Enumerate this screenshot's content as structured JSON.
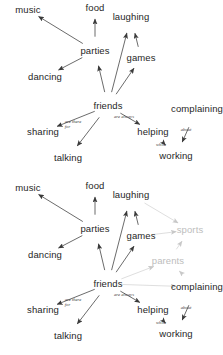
{
  "diagram": {
    "kind": "concept-map",
    "colors": {
      "node": "#262626",
      "edge": "#3a3a3a",
      "faded_node": "#bdbdbd",
      "faded_edge": "#c8c8c8",
      "background": "#ffffff"
    },
    "panels": [
      {
        "id": "panel-1",
        "name": "base-concept-map",
        "nodes": [
          {
            "id": "music",
            "label": "music",
            "x": 28,
            "y": 10,
            "state": "normal"
          },
          {
            "id": "food",
            "label": "food",
            "x": 95,
            "y": 8,
            "state": "normal"
          },
          {
            "id": "laughing",
            "label": "laughing",
            "x": 131,
            "y": 17,
            "state": "normal"
          },
          {
            "id": "parties",
            "label": "parties",
            "x": 95,
            "y": 51,
            "state": "normal"
          },
          {
            "id": "games",
            "label": "games",
            "x": 141,
            "y": 58,
            "state": "normal"
          },
          {
            "id": "dancing",
            "label": "dancing",
            "x": 45,
            "y": 77,
            "state": "normal"
          },
          {
            "id": "friends",
            "label": "friends",
            "x": 108,
            "y": 106,
            "state": "normal"
          },
          {
            "id": "complaining",
            "label": "complaining",
            "x": 197,
            "y": 109,
            "state": "normal"
          },
          {
            "id": "sharing",
            "label": "sharing",
            "x": 43,
            "y": 132,
            "state": "normal"
          },
          {
            "id": "helping",
            "label": "helping",
            "x": 153,
            "y": 132,
            "state": "normal"
          },
          {
            "id": "talking",
            "label": "talking",
            "x": 68,
            "y": 158,
            "state": "normal"
          },
          {
            "id": "working",
            "label": "working",
            "x": 176,
            "y": 156,
            "state": "normal"
          }
        ],
        "edges": [
          {
            "from": "parties",
            "to": "music",
            "state": "normal"
          },
          {
            "from": "parties",
            "to": "food",
            "state": "normal"
          },
          {
            "from": "parties",
            "to": "dancing",
            "state": "normal"
          },
          {
            "from": "friends",
            "to": "parties",
            "state": "normal"
          },
          {
            "from": "friends",
            "to": "laughing",
            "state": "normal"
          },
          {
            "from": "friends",
            "to": "games",
            "state": "normal"
          },
          {
            "from": "games",
            "to": "laughing",
            "state": "normal"
          },
          {
            "from": "friends",
            "to": "sharing",
            "state": "normal",
            "label": "are there for"
          },
          {
            "from": "friends",
            "to": "talking",
            "state": "normal"
          },
          {
            "from": "friends",
            "to": "helping",
            "state": "normal",
            "label": "are always"
          },
          {
            "from": "helping",
            "to": "working",
            "state": "normal",
            "label": "while"
          },
          {
            "from": "complaining",
            "to": "working",
            "state": "normal",
            "label": "about"
          }
        ],
        "edge_labels": [
          {
            "id": "are-there-for",
            "line1": "are there",
            "line2": "for",
            "x": 73,
            "y": 124
          },
          {
            "id": "are-always",
            "line1": "are always",
            "line2": "",
            "x": 124,
            "y": 117
          },
          {
            "id": "while",
            "line1": "while",
            "line2": "",
            "x": 161,
            "y": 145
          },
          {
            "id": "about",
            "line1": "about",
            "line2": "",
            "x": 186,
            "y": 130
          }
        ]
      },
      {
        "id": "panel-2",
        "name": "extended-concept-map",
        "nodes": [
          {
            "id": "music",
            "label": "music",
            "x": 28,
            "y": 10,
            "state": "normal"
          },
          {
            "id": "food",
            "label": "food",
            "x": 95,
            "y": 8,
            "state": "normal"
          },
          {
            "id": "laughing",
            "label": "laughing",
            "x": 131,
            "y": 17,
            "state": "normal"
          },
          {
            "id": "parties",
            "label": "parties",
            "x": 95,
            "y": 51,
            "state": "normal"
          },
          {
            "id": "games",
            "label": "games",
            "x": 141,
            "y": 58,
            "state": "normal"
          },
          {
            "id": "dancing",
            "label": "dancing",
            "x": 45,
            "y": 77,
            "state": "normal"
          },
          {
            "id": "sports",
            "label": "sports",
            "x": 190,
            "y": 52,
            "state": "faded"
          },
          {
            "id": "parents",
            "label": "parents",
            "x": 168,
            "y": 83,
            "state": "faded"
          },
          {
            "id": "friends",
            "label": "friends",
            "x": 108,
            "y": 106,
            "state": "normal"
          },
          {
            "id": "complaining",
            "label": "complaining",
            "x": 197,
            "y": 109,
            "state": "normal"
          },
          {
            "id": "sharing",
            "label": "sharing",
            "x": 43,
            "y": 132,
            "state": "normal"
          },
          {
            "id": "helping",
            "label": "helping",
            "x": 153,
            "y": 132,
            "state": "normal"
          },
          {
            "id": "talking",
            "label": "talking",
            "x": 68,
            "y": 158,
            "state": "normal"
          },
          {
            "id": "working",
            "label": "working",
            "x": 176,
            "y": 156,
            "state": "normal"
          }
        ],
        "edges": [
          {
            "from": "parties",
            "to": "music",
            "state": "normal"
          },
          {
            "from": "parties",
            "to": "food",
            "state": "normal"
          },
          {
            "from": "parties",
            "to": "dancing",
            "state": "normal"
          },
          {
            "from": "friends",
            "to": "parties",
            "state": "normal"
          },
          {
            "from": "friends",
            "to": "laughing",
            "state": "normal"
          },
          {
            "from": "friends",
            "to": "games",
            "state": "normal"
          },
          {
            "from": "games",
            "to": "laughing",
            "state": "normal"
          },
          {
            "from": "laughing",
            "to": "sports",
            "state": "faded"
          },
          {
            "from": "games",
            "to": "sports",
            "state": "faded"
          },
          {
            "from": "parents",
            "to": "sports",
            "state": "faded"
          },
          {
            "from": "friends",
            "to": "parents",
            "state": "faded"
          },
          {
            "from": "complaining",
            "to": "parents",
            "state": "faded"
          },
          {
            "from": "friends",
            "to": "complaining",
            "state": "faded"
          },
          {
            "from": "friends",
            "to": "sharing",
            "state": "normal",
            "label": "are there for"
          },
          {
            "from": "friends",
            "to": "talking",
            "state": "normal"
          },
          {
            "from": "friends",
            "to": "helping",
            "state": "normal",
            "label": "are always"
          },
          {
            "from": "helping",
            "to": "working",
            "state": "normal",
            "label": "while"
          },
          {
            "from": "complaining",
            "to": "working",
            "state": "normal",
            "label": "about"
          }
        ],
        "edge_labels": [
          {
            "id": "are-there-for",
            "line1": "are there",
            "line2": "for",
            "x": 73,
            "y": 124
          },
          {
            "id": "are-always",
            "line1": "are always",
            "line2": "",
            "x": 124,
            "y": 117
          },
          {
            "id": "while",
            "line1": "while",
            "line2": "",
            "x": 161,
            "y": 145
          },
          {
            "id": "about",
            "line1": "about",
            "line2": "",
            "x": 186,
            "y": 130
          }
        ]
      }
    ]
  }
}
